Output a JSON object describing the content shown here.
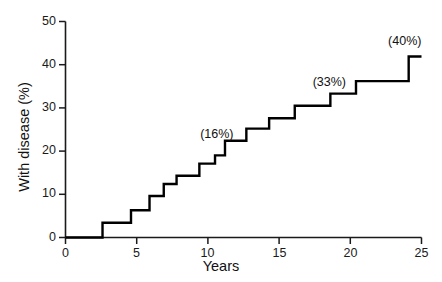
{
  "chart_data": {
    "type": "line",
    "subtype": "step-function-cumulative-incidence",
    "title": "",
    "xlabel": "Years",
    "ylabel": "With disease (%)",
    "xlim": [
      0,
      25
    ],
    "ylim": [
      0,
      50
    ],
    "xticks": [
      0,
      5,
      10,
      15,
      20,
      25
    ],
    "yticks": [
      0,
      10,
      20,
      30,
      40,
      50
    ],
    "xtick_labels": [
      "0",
      "5",
      "10",
      "15",
      "20",
      "25"
    ],
    "ytick_labels": [
      "0",
      "10",
      "20",
      "30",
      "40",
      "50"
    ],
    "grid": false,
    "legend": null,
    "series": [
      {
        "name": "Cumulative proportion with disease",
        "color": "#000000",
        "step": "post",
        "x": [
          0,
          2.6,
          2.6,
          4.6,
          4.6,
          5.9,
          5.9,
          6.9,
          6.9,
          7.8,
          7.8,
          9.4,
          9.4,
          10.5,
          10.5,
          11.2,
          11.2,
          11.6,
          11.6,
          12.7,
          12.7,
          14.3,
          14.3,
          16.1,
          16.1,
          18.6,
          18.6,
          20.4,
          20.4,
          24.1,
          24.1,
          25.0
        ],
        "y": [
          0,
          0,
          3.4,
          3.4,
          6.3,
          6.3,
          9.6,
          9.6,
          12.4,
          12.4,
          14.3,
          14.3,
          17.1,
          17.1,
          19.0,
          19.0,
          22.4,
          22.4,
          22.4,
          22.4,
          25.2,
          25.2,
          27.6,
          27.6,
          30.5,
          30.5,
          33.3,
          33.3,
          36.2,
          36.2,
          41.9,
          41.9
        ],
        "points": [
          {
            "x": 0.0,
            "y": 0.0
          },
          {
            "x": 2.6,
            "y": 3.4
          },
          {
            "x": 4.6,
            "y": 6.3
          },
          {
            "x": 5.9,
            "y": 9.6
          },
          {
            "x": 6.9,
            "y": 12.4
          },
          {
            "x": 7.8,
            "y": 14.3
          },
          {
            "x": 9.4,
            "y": 17.1
          },
          {
            "x": 10.5,
            "y": 19.0
          },
          {
            "x": 11.2,
            "y": 22.4
          },
          {
            "x": 12.7,
            "y": 25.2
          },
          {
            "x": 14.3,
            "y": 27.6
          },
          {
            "x": 16.1,
            "y": 30.5
          },
          {
            "x": 18.6,
            "y": 33.3
          },
          {
            "x": 20.4,
            "y": 36.2
          },
          {
            "x": 24.1,
            "y": 41.9
          }
        ]
      }
    ],
    "annotations": [
      {
        "text": "(16%)",
        "x": 11.0,
        "y": 23.5,
        "value": 16
      },
      {
        "text": "(33%)",
        "x": 18.9,
        "y": 35.5,
        "value": 33
      },
      {
        "text": "(40%)",
        "x": 24.2,
        "y": 45.0,
        "value": 40
      }
    ]
  },
  "axes": {
    "y_title": "With disease (%)",
    "x_title": "Years",
    "y_ticks": [
      {
        "label": "50",
        "value": 50
      },
      {
        "label": "40",
        "value": 40
      },
      {
        "label": "30",
        "value": 30
      },
      {
        "label": "20",
        "value": 20
      },
      {
        "label": "10",
        "value": 10
      },
      {
        "label": "0",
        "value": 0
      }
    ],
    "x_ticks": [
      {
        "label": "0",
        "value": 0
      },
      {
        "label": "5",
        "value": 5
      },
      {
        "label": "10",
        "value": 10
      },
      {
        "label": "15",
        "value": 15
      },
      {
        "label": "20",
        "value": 20
      },
      {
        "label": "25",
        "value": 25
      }
    ]
  },
  "annotations": {
    "a0": "(16%)",
    "a1": "(33%)",
    "a2": "(40%)"
  },
  "colors": {
    "background": "#ffffff",
    "line": "#000000",
    "axis": "#1a1a1a",
    "text": "#111111"
  }
}
